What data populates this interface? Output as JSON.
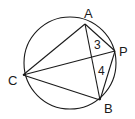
{
  "diagram": {
    "circle": {
      "cx": 70,
      "cy": 63,
      "r": 46
    },
    "points": {
      "A": {
        "x": 85,
        "y": 24
      },
      "P": {
        "x": 115,
        "y": 51
      },
      "B": {
        "x": 100,
        "y": 100
      },
      "C": {
        "x": 23,
        "y": 75
      }
    },
    "labels": {
      "A": "A",
      "P": "P",
      "B": "B",
      "C": "C"
    },
    "angle_labels": {
      "angle3": "3",
      "angle4": "4"
    },
    "segments": [
      "AP",
      "PB",
      "AB",
      "CA",
      "CP",
      "CB"
    ]
  }
}
